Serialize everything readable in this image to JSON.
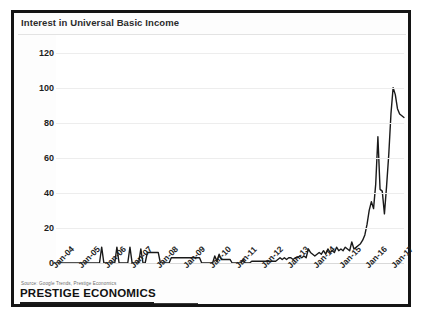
{
  "slide": {
    "title": "Interest in Universal Basic Income",
    "source_note": "Source:  Google Trends, Prestige Economics",
    "brand": "PRESTIGE ECONOMICS"
  },
  "colors": {
    "frame": "#141414",
    "line": "#1a1a1a",
    "grid": "#ededed",
    "text": "#1d1d1d",
    "title_text": "#2b2b2b",
    "source_text": "#6d6d6d",
    "background": "#ffffff"
  },
  "chart_data": {
    "type": "line",
    "title": "Interest in Universal Basic Income",
    "xlabel": "",
    "ylabel": "",
    "ylim": [
      0,
      130
    ],
    "yticks": [
      0,
      20,
      40,
      60,
      80,
      100,
      120
    ],
    "ytick_labels": [
      "0",
      "20",
      "40",
      "60",
      "80",
      "100",
      "120"
    ],
    "grid": true,
    "legend": false,
    "xtick_labels": [
      "Jan-04",
      "Jan-05",
      "Jan-06",
      "Jan-07",
      "Jan-08",
      "Jan-09",
      "Jan-10",
      "Jan-11",
      "Jan-12",
      "Jan-13",
      "Jan-14",
      "Jan-15",
      "Jan-16",
      "Jan-17"
    ],
    "xtick_index": [
      0,
      12,
      24,
      36,
      48,
      60,
      72,
      84,
      96,
      108,
      120,
      132,
      144,
      156
    ],
    "x_start": "2004-01",
    "x_end": "2017-05",
    "x_frequency": "monthly",
    "n_points": 161,
    "values": [
      0,
      0,
      0,
      0,
      0,
      0,
      0,
      0,
      0,
      0,
      0,
      0,
      0,
      0,
      0,
      0,
      0,
      0,
      0,
      0,
      0,
      9,
      0,
      0,
      0,
      0,
      0,
      0,
      9,
      0,
      0,
      0,
      0,
      0,
      9,
      0,
      0,
      0,
      0,
      8,
      0,
      0,
      6,
      6,
      6,
      6,
      6,
      6,
      0,
      0,
      0,
      0,
      0,
      3,
      3,
      3,
      3,
      3,
      3,
      3,
      3,
      3,
      3,
      3,
      3,
      3,
      3,
      0,
      0,
      0,
      0,
      0,
      0,
      4,
      1,
      5,
      2,
      2,
      2,
      2,
      2,
      0,
      0,
      0,
      0,
      0,
      2,
      0,
      0,
      0,
      1,
      1,
      1,
      1,
      1,
      1,
      1,
      1,
      1,
      1,
      1,
      1,
      2,
      3,
      2,
      3,
      2,
      3,
      3,
      2,
      3,
      3,
      4,
      3,
      4,
      3,
      8,
      6,
      5,
      4,
      5,
      6,
      5,
      7,
      5,
      8,
      6,
      7,
      6,
      9,
      7,
      8,
      7,
      9,
      8,
      7,
      12,
      8,
      9,
      10,
      11,
      13,
      16,
      22,
      30,
      35,
      31,
      45,
      72,
      42,
      41,
      28,
      44,
      62,
      85,
      100,
      96,
      88,
      85,
      84,
      83
    ],
    "annotations": {
      "peak_value": 100,
      "secondary_peak_value": 72,
      "final_value": 83,
      "trough_after_peak": 28
    }
  }
}
